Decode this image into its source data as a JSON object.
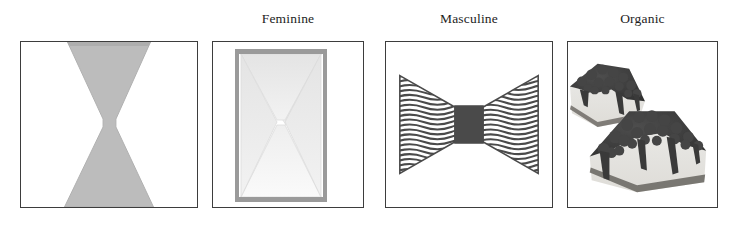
{
  "figure": {
    "background_color": "#ffffff",
    "panel_border_color": "#3d3d3d",
    "panels": [
      {
        "id": "plain",
        "caption": "",
        "has_caption": false,
        "description": "bowtie-solid-grey",
        "shape_fill": "#bcbcbc",
        "shape_edge": "#a8a8a8"
      },
      {
        "id": "feminine",
        "caption": "Feminine",
        "has_caption": true,
        "description": "bowtie-pale-gradient-in-grey-frame",
        "frame_color": "#9a9a9a",
        "shape_fill": "#e9e9e9",
        "shape_edge": "#d6d6d6"
      },
      {
        "id": "masculine",
        "caption": "Masculine",
        "has_caption": true,
        "description": "bowtie-wavy-lines-with-dark-knot",
        "line_color": "#4a4a4a",
        "knot_color": "#4a4a4a",
        "wave_line_count": 21
      },
      {
        "id": "organic",
        "caption": "Organic",
        "has_caption": true,
        "description": "photograph-two-slices-berry-topped-cheesecake",
        "topping_color": "#3f3f3f",
        "cake_color": "#e6e4df",
        "crust_color": "#6e6b66"
      }
    ]
  }
}
